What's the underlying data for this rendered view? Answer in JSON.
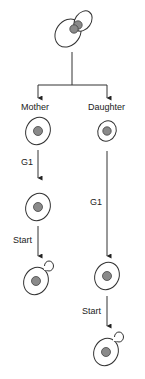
{
  "diagram": {
    "branches": {
      "mother": {
        "label": "Mother",
        "phases": [
          "G1",
          "Start"
        ]
      },
      "daughter": {
        "label": "Daughter",
        "phases": [
          "G1",
          "Start"
        ]
      }
    },
    "colors": {
      "line": "#333333",
      "cell_outline": "#333333",
      "nucleus": "#8a8a8a",
      "nucleus_outline": "#444444"
    }
  }
}
